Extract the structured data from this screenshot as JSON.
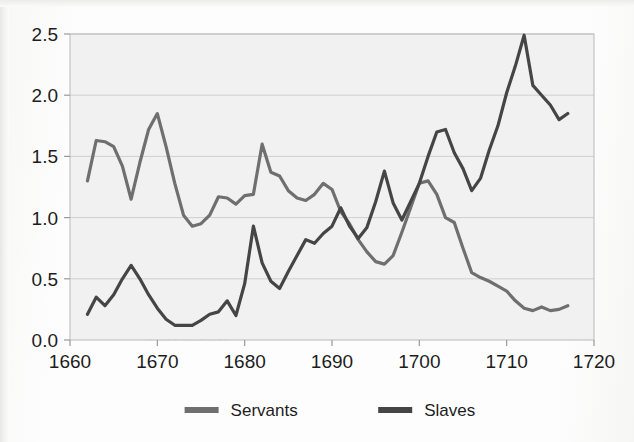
{
  "figure": {
    "background_color": "#fdfdfd",
    "plot_background_color": "#f1f1f1",
    "plot_border_color": "#b9b9b9",
    "gridline_color": "#cfcfcf",
    "axis_color": "#9a9a9a",
    "tick_text_color": "#1d1d1d"
  },
  "bleed_through_text": {
    "line1": "a time and was often accorded the",
    "line2": "ced the Chesapeake, but",
    "line3": "former quantities that it would make",
    "line4": "ught the very bottom of the labour",
    "line5": "of the working population in",
    "line6": "nd that the only partially successful",
    "line7": "n the market"
  },
  "legend": {
    "position": "bottom-center",
    "entries": [
      {
        "label": "Servants",
        "color": "#6f6f6f"
      },
      {
        "label": "Slaves",
        "color": "#454545"
      }
    ]
  },
  "chart_data": {
    "type": "line",
    "title": "",
    "subtitle": "",
    "xlabel": "",
    "ylabel": "",
    "xlim": [
      1660,
      1720
    ],
    "ylim": [
      0.0,
      2.5
    ],
    "xticks": [
      1660,
      1670,
      1680,
      1690,
      1700,
      1710,
      1720
    ],
    "xtick_labels": [
      "1660",
      "1670",
      "1680",
      "1690",
      "1700",
      "1710",
      "1720"
    ],
    "yticks": [
      0.0,
      0.5,
      1.0,
      1.5,
      2.0,
      2.5
    ],
    "ytick_labels": [
      "0.0",
      "0.5",
      "1.0",
      "1.5",
      "2.0",
      "2.5"
    ],
    "grid": "horizontal",
    "legend_position": "bottom-center",
    "series": [
      {
        "name": "Servants",
        "color": "#6f6f6f",
        "line_width": 3.2,
        "x": [
          1662,
          1663,
          1664,
          1665,
          1666,
          1667,
          1668,
          1669,
          1670,
          1671,
          1672,
          1673,
          1674,
          1675,
          1676,
          1677,
          1678,
          1679,
          1680,
          1681,
          1682,
          1683,
          1684,
          1685,
          1686,
          1687,
          1688,
          1689,
          1690,
          1691,
          1692,
          1693,
          1694,
          1695,
          1696,
          1697,
          1698,
          1699,
          1700,
          1701,
          1702,
          1703,
          1704,
          1705,
          1706,
          1707,
          1708,
          1709,
          1710,
          1711,
          1712,
          1713,
          1714,
          1715,
          1716,
          1717
        ],
        "y": [
          1.3,
          1.63,
          1.62,
          1.58,
          1.42,
          1.15,
          1.45,
          1.72,
          1.85,
          1.58,
          1.28,
          1.02,
          0.93,
          0.95,
          1.02,
          1.17,
          1.16,
          1.11,
          1.18,
          1.19,
          1.6,
          1.37,
          1.34,
          1.22,
          1.16,
          1.14,
          1.19,
          1.28,
          1.23,
          1.05,
          0.95,
          0.82,
          0.72,
          0.64,
          0.62,
          0.69,
          0.88,
          1.08,
          1.28,
          1.3,
          1.19,
          1.0,
          0.96,
          0.75,
          0.55,
          0.51,
          0.48,
          0.44,
          0.4,
          0.32,
          0.26,
          0.24,
          0.27,
          0.24,
          0.25,
          0.28
        ]
      },
      {
        "name": "Slaves",
        "color": "#454545",
        "line_width": 3.2,
        "x": [
          1662,
          1663,
          1664,
          1665,
          1666,
          1667,
          1668,
          1669,
          1670,
          1671,
          1672,
          1673,
          1674,
          1675,
          1676,
          1677,
          1678,
          1679,
          1680,
          1681,
          1682,
          1683,
          1684,
          1685,
          1686,
          1687,
          1688,
          1689,
          1690,
          1691,
          1692,
          1693,
          1694,
          1695,
          1696,
          1697,
          1698,
          1699,
          1700,
          1701,
          1702,
          1703,
          1704,
          1705,
          1706,
          1707,
          1708,
          1709,
          1710,
          1711,
          1712,
          1713,
          1714,
          1715,
          1716,
          1717
        ],
        "y": [
          0.21,
          0.35,
          0.28,
          0.37,
          0.5,
          0.61,
          0.5,
          0.37,
          0.26,
          0.17,
          0.12,
          0.12,
          0.12,
          0.16,
          0.21,
          0.23,
          0.32,
          0.2,
          0.46,
          0.93,
          0.63,
          0.48,
          0.42,
          0.56,
          0.69,
          0.82,
          0.79,
          0.87,
          0.93,
          1.08,
          0.93,
          0.83,
          0.92,
          1.13,
          1.38,
          1.12,
          0.98,
          1.13,
          1.28,
          1.5,
          1.7,
          1.72,
          1.53,
          1.4,
          1.22,
          1.32,
          1.55,
          1.75,
          2.02,
          2.24,
          2.49,
          2.08,
          2.0,
          1.92,
          1.8,
          1.85
        ]
      }
    ]
  }
}
